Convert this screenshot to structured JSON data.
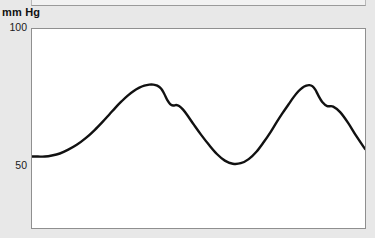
{
  "page": {
    "background_color": "#e8e8e8",
    "width": 375,
    "height": 238
  },
  "labels": {
    "unit": "mm Hg",
    "tick_top": "100",
    "tick_mid": "50"
  },
  "plot": {
    "background_color": "#ffffff",
    "border_color": "#8f8f8f",
    "line_color": "#111111",
    "line_width": 2.4
  },
  "chart_data": {
    "type": "line",
    "title": "",
    "xlabel": "",
    "ylabel": "mm Hg",
    "ylim": [
      22,
      100
    ],
    "yticks": [
      50,
      100
    ],
    "ytick_labels": [
      "50",
      "100"
    ],
    "xlim": [
      0,
      335
    ],
    "grid": false,
    "legend": null,
    "annotations": [
      "arterial blood pressure waveform",
      "dicrotic notch after each systolic peak"
    ],
    "series": [
      {
        "name": "arterial pressure",
        "units": "mm Hg",
        "systolic_peak": 78,
        "diastolic_trough": 47,
        "baseline_start": 50,
        "cycles": 2.3,
        "x": [
          0,
          6,
          13,
          20,
          28,
          36,
          45,
          54,
          63,
          71,
          78,
          84,
          90,
          96,
          102,
          108,
          113,
          118,
          122,
          126,
          130,
          133,
          136,
          139,
          142,
          145,
          148,
          152,
          157,
          163,
          170,
          178,
          186,
          194,
          202,
          210,
          218,
          226,
          233,
          240,
          246,
          252,
          258,
          263,
          268,
          272,
          276,
          279,
          282,
          285,
          288,
          292,
          297,
          303,
          310,
          318,
          326,
          335
        ],
        "y": [
          50,
          50,
          50,
          50.4,
          51.2,
          52.6,
          54.6,
          57.2,
          60.4,
          63.6,
          66.6,
          69.2,
          71.6,
          73.8,
          75.6,
          77.0,
          77.8,
          78.2,
          78.2,
          77.8,
          76.6,
          74.6,
          72.2,
          70.6,
          70.0,
          70.2,
          69.8,
          68.4,
          65.8,
          62.4,
          58.6,
          54.6,
          51.0,
          48.4,
          47.2,
          47.4,
          49.0,
          52.0,
          55.6,
          59.6,
          63.4,
          67.0,
          70.4,
          73.2,
          75.6,
          77.0,
          77.8,
          78.0,
          77.6,
          76.2,
          74.0,
          71.4,
          69.8,
          69.6,
          67.4,
          63.2,
          58.2,
          53.0
        ]
      }
    ]
  }
}
